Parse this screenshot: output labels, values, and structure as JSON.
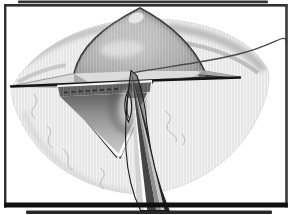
{
  "figure": {
    "type": "surgical-illustration",
    "colors": {
      "background": "#ffffff",
      "frame": "#2f2f2f",
      "frame_bottom": "#101010",
      "eye_surface": "#e6e6e6",
      "eyelid_shadow": "#bdbdbd",
      "vessel": "#b4b4b4",
      "dome_outline": "#2c2c2c",
      "dome_mid": "#ababab",
      "dome_highlight": "#e8e8e8",
      "shelf_face": "#dcdcdc",
      "shelf_edge": "#141414",
      "wing_dark": "#3c3c3c",
      "hinge_shadow": "#5c5c5c",
      "bed_dark": "#5f5f5f",
      "bed_light": "#cacaca",
      "cut_edge_white": "#fafafa",
      "slit_outline": "#1f1f1f",
      "slit_fill": "#d8d8d8",
      "blade_dark": "#454545",
      "blade_light": "#fbfbfb",
      "suture": "#4a4a4a"
    }
  }
}
